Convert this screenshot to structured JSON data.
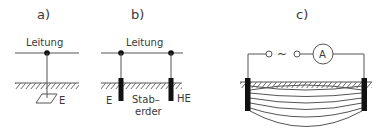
{
  "panels": {
    "a": {
      "label": "a)",
      "line_label": "Leitung",
      "electrode_label": "E"
    },
    "b": {
      "label": "b)",
      "line_label": "Leitung",
      "electrode_left_label": "E",
      "rod_label_line1": "Stab–",
      "rod_label_line2": "erder",
      "electrode_right_label": "HE"
    },
    "c": {
      "label": "c)",
      "source_symbol": "~",
      "meter_symbol": "A"
    }
  },
  "colors": {
    "stroke": "#444444",
    "fill_dark": "#111111",
    "text": "#3a3a3a"
  }
}
